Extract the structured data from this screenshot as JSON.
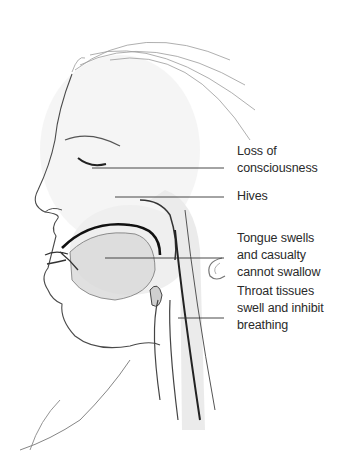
{
  "diagram": {
    "labels": [
      {
        "id": "consciousness",
        "text": "Loss of\nconsciousness",
        "top": 143,
        "line_y": 168,
        "line_x1": 92,
        "line_x2": 224
      },
      {
        "id": "hives",
        "text": "Hives",
        "top": 188,
        "line_y": 197,
        "line_x1": 115,
        "line_x2": 224
      },
      {
        "id": "tongue",
        "text": "Tongue swells\nand casualty\ncannot swallow",
        "top": 230,
        "line_y": 258,
        "line_x1": 105,
        "line_x2": 224
      },
      {
        "id": "throat",
        "text": "Throat tissues\nswell and inhibit\nbreathing",
        "top": 283,
        "line_y": 318,
        "line_x1": 178,
        "line_x2": 224
      }
    ],
    "colors": {
      "line": "#333333",
      "sketch": "#6a6a6a",
      "shade": "#d8d8d8",
      "text": "#2a2a2a"
    }
  }
}
